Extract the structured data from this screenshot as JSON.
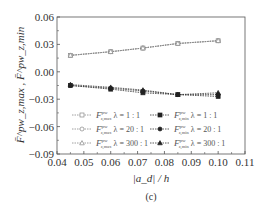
{
  "chart_data": {
    "type": "line",
    "title": "",
    "caption": "(c)",
    "xlabel": "|a_d| / h",
    "ylabel": "F̄^pw_z,max , F̄^pw_z,min",
    "xlim": [
      0.04,
      0.11
    ],
    "ylim": [
      -0.09,
      0.06
    ],
    "xticks": [
      "0.04",
      "0.05",
      "0.06",
      "0.07",
      "0.08",
      "0.09",
      "0.10",
      "0.11"
    ],
    "yticks": [
      "0.06",
      "0.03",
      "0.00",
      "−0.03",
      "−0.06",
      "−0.09"
    ],
    "grid": false,
    "legend_position": "lower inside, two columns",
    "x": [
      0.045,
      0.06,
      0.072,
      0.085,
      0.1
    ],
    "series": [
      {
        "name": "F̄^pw_z,max  λ = 1:1",
        "marker": "open-square",
        "values": [
          0.018,
          0.022,
          0.026,
          0.031,
          0.034
        ]
      },
      {
        "name": "F̄^pw_z,max  λ = 20:1",
        "marker": "open-circle",
        "values": [
          0.018,
          0.022,
          0.026,
          0.031,
          0.034
        ]
      },
      {
        "name": "F̄^pw_z,max  λ = 300:1",
        "marker": "open-triangle",
        "values": [
          0.018,
          0.022,
          0.026,
          0.031,
          0.034
        ]
      },
      {
        "name": "F̄^pw_z,min  λ = 1:1",
        "marker": "filled-square",
        "values": [
          -0.015,
          -0.019,
          -0.023,
          -0.025,
          -0.027
        ]
      },
      {
        "name": "F̄^pw_z,min  λ = 20:1",
        "marker": "filled-circle",
        "values": [
          -0.015,
          -0.018,
          -0.021,
          -0.025,
          -0.025
        ]
      },
      {
        "name": "F̄^pw_z,min  λ = 300:1",
        "marker": "filled-triangle",
        "values": [
          -0.014,
          -0.017,
          -0.02,
          -0.025,
          -0.023
        ]
      }
    ]
  },
  "legend": [
    {
      "sym": "F",
      "sub": "z,max",
      "sup": "pw",
      "lambda": "λ = 1 : 1"
    },
    {
      "sym": "F",
      "sub": "z,min",
      "sup": "pw",
      "lambda": "λ = 1 : 1"
    },
    {
      "sym": "F",
      "sub": "z,max",
      "sup": "pw",
      "lambda": "λ = 20 : 1"
    },
    {
      "sym": "F",
      "sub": "z,min",
      "sup": "pw",
      "lambda": "λ = 20 : 1"
    },
    {
      "sym": "F",
      "sub": "z,max",
      "sup": "pw",
      "lambda": "λ = 300 : 1"
    },
    {
      "sym": "F",
      "sub": "z,min",
      "sup": "pw",
      "lambda": "λ = 300 : 1"
    }
  ]
}
